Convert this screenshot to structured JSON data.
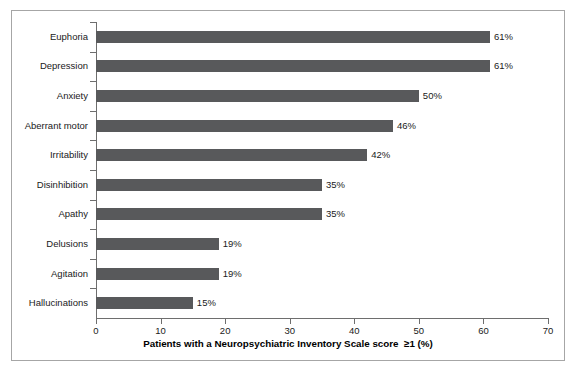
{
  "chart_data": {
    "type": "bar",
    "orientation": "horizontal",
    "title": "",
    "xlabel": "Patients with a Neuropsychiatric Inventory Scale score  ≥1 (%)",
    "ylabel": "",
    "xlim": [
      0,
      70
    ],
    "xticks": [
      0,
      10,
      20,
      30,
      40,
      50,
      60,
      70
    ],
    "xtick_labels": [
      "0",
      "10",
      "20",
      "30",
      "40",
      "50",
      "60",
      "70"
    ],
    "grid": false,
    "legend": null,
    "bar_color": "#58595B",
    "axis_color": "#6E6E6E",
    "categories": [
      "Euphoria",
      "Depression",
      "Anxiety",
      "Aberrant motor",
      "Irritability",
      "Disinhibition",
      "Apathy",
      "Delusions",
      "Agitation",
      "Hallucinations"
    ],
    "values": [
      61,
      61,
      50,
      46,
      42,
      35,
      35,
      19,
      19,
      15
    ],
    "value_labels": [
      "61%",
      "61%",
      "50%",
      "46%",
      "42%",
      "35%",
      "35%",
      "19%",
      "19%",
      "15%"
    ]
  }
}
